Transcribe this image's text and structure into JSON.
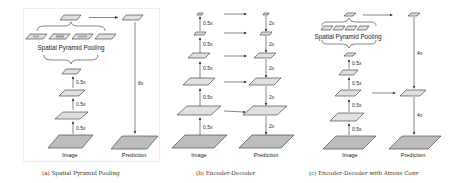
{
  "figure": {
    "panels": [
      {
        "id": "a",
        "caption": "(a) Spatial Pyramid Pooling",
        "module_label": "Spatial Pyramid Pooling",
        "input_label": "Image",
        "output_label": "Prediction",
        "encoder_scales": [
          "0.5x",
          "0.5x",
          "0.5x"
        ],
        "upsample_label": "8x"
      },
      {
        "id": "b",
        "caption": "(b) Encoder-Decoder",
        "input_label": "Image",
        "output_label": "Prediction",
        "encoder_scales": [
          "0.5x",
          "0.5x",
          "0.5x",
          "0.5x",
          "0.5x"
        ],
        "decoder_scales": [
          "2x",
          "2x",
          "2x",
          "2x",
          "2x"
        ]
      },
      {
        "id": "c",
        "caption": "(c) Encoder-Decoder with Atrous Conv",
        "module_label": "Spatial Pyramid Pooling",
        "input_label": "Image",
        "output_label": "Prediction",
        "encoder_scales": [
          "0.5x",
          "0.5x",
          "0.5x",
          "0.5x"
        ],
        "decoder_scales": [
          "4x",
          "4x"
        ]
      }
    ]
  },
  "colors": {
    "feature_map_fill": "#e0e0e0",
    "prediction_fill": "#bdbdbd",
    "stroke": "#333333"
  }
}
